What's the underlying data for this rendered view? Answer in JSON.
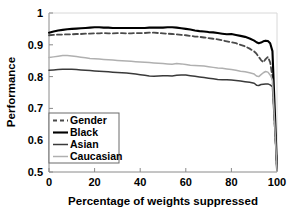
{
  "chart_data": {
    "type": "line",
    "title": "",
    "xlabel": "Percentage of weights suppressed",
    "ylabel": "Performance",
    "xlim": [
      0,
      100
    ],
    "ylim": [
      0.5,
      1.0
    ],
    "xticks": [
      "0",
      "20",
      "40",
      "60",
      "80",
      "100"
    ],
    "xtick_values": [
      0,
      20,
      40,
      60,
      80,
      100
    ],
    "yticks": [
      "0.5",
      "0.6",
      "0.7",
      "0.8",
      "0.9",
      "1"
    ],
    "ytick_values": [
      0.5,
      0.6,
      0.7,
      0.8,
      0.9,
      1.0
    ],
    "grid": false,
    "legend_position": "lower left",
    "x": [
      0,
      2,
      4,
      6,
      8,
      10,
      12,
      14,
      16,
      18,
      20,
      22,
      24,
      26,
      28,
      30,
      32,
      34,
      36,
      38,
      40,
      42,
      44,
      46,
      48,
      50,
      52,
      54,
      56,
      58,
      60,
      62,
      64,
      66,
      68,
      70,
      72,
      74,
      76,
      78,
      80,
      82,
      84,
      86,
      88,
      90,
      91,
      92,
      93,
      94,
      95,
      96,
      97,
      98,
      99,
      100
    ],
    "series": [
      {
        "name": "Gender",
        "style": "dashed",
        "color": "#4a4a4a",
        "width": 1.8,
        "values": [
          0.93,
          0.931,
          0.932,
          0.932,
          0.933,
          0.933,
          0.934,
          0.934,
          0.935,
          0.935,
          0.936,
          0.936,
          0.937,
          0.936,
          0.936,
          0.937,
          0.937,
          0.936,
          0.936,
          0.937,
          0.937,
          0.937,
          0.938,
          0.938,
          0.937,
          0.936,
          0.935,
          0.934,
          0.933,
          0.931,
          0.93,
          0.928,
          0.926,
          0.925,
          0.923,
          0.921,
          0.919,
          0.917,
          0.914,
          0.911,
          0.908,
          0.905,
          0.9,
          0.895,
          0.888,
          0.879,
          0.872,
          0.862,
          0.852,
          0.845,
          0.855,
          0.862,
          0.845,
          0.8,
          0.65,
          0.51
        ]
      },
      {
        "name": "Black",
        "style": "solid",
        "color": "#000000",
        "width": 2.1,
        "values": [
          0.938,
          0.942,
          0.945,
          0.947,
          0.949,
          0.95,
          0.951,
          0.952,
          0.953,
          0.954,
          0.955,
          0.955,
          0.954,
          0.954,
          0.953,
          0.953,
          0.953,
          0.953,
          0.953,
          0.953,
          0.953,
          0.953,
          0.954,
          0.954,
          0.954,
          0.954,
          0.955,
          0.955,
          0.954,
          0.952,
          0.95,
          0.948,
          0.945,
          0.943,
          0.942,
          0.94,
          0.939,
          0.937,
          0.935,
          0.933,
          0.934,
          0.931,
          0.928,
          0.925,
          0.92,
          0.913,
          0.908,
          0.905,
          0.907,
          0.911,
          0.913,
          0.912,
          0.905,
          0.88,
          0.7,
          0.51
        ]
      },
      {
        "name": "Asian",
        "style": "solid",
        "color": "#3a3a3a",
        "width": 1.5,
        "values": [
          0.82,
          0.821,
          0.822,
          0.823,
          0.823,
          0.823,
          0.822,
          0.821,
          0.82,
          0.819,
          0.818,
          0.817,
          0.816,
          0.815,
          0.814,
          0.813,
          0.812,
          0.811,
          0.81,
          0.808,
          0.806,
          0.804,
          0.802,
          0.801,
          0.802,
          0.803,
          0.803,
          0.802,
          0.804,
          0.805,
          0.805,
          0.803,
          0.801,
          0.799,
          0.797,
          0.795,
          0.793,
          0.791,
          0.79,
          0.79,
          0.789,
          0.788,
          0.786,
          0.784,
          0.782,
          0.779,
          0.773,
          0.772,
          0.775,
          0.776,
          0.777,
          0.777,
          0.774,
          0.768,
          0.64,
          0.505
        ]
      },
      {
        "name": "Caucasian",
        "style": "solid",
        "color": "#b0b0b0",
        "width": 1.5,
        "values": [
          0.86,
          0.862,
          0.864,
          0.866,
          0.866,
          0.865,
          0.863,
          0.861,
          0.859,
          0.857,
          0.856,
          0.855,
          0.854,
          0.853,
          0.852,
          0.851,
          0.85,
          0.849,
          0.848,
          0.847,
          0.846,
          0.845,
          0.844,
          0.843,
          0.842,
          0.841,
          0.84,
          0.839,
          0.841,
          0.84,
          0.838,
          0.836,
          0.835,
          0.834,
          0.833,
          0.831,
          0.829,
          0.827,
          0.826,
          0.824,
          0.822,
          0.82,
          0.817,
          0.815,
          0.812,
          0.808,
          0.802,
          0.8,
          0.806,
          0.812,
          0.816,
          0.814,
          0.805,
          0.79,
          0.65,
          0.505
        ]
      }
    ]
  },
  "legend": {
    "entries": [
      {
        "label": "Gender"
      },
      {
        "label": "Black"
      },
      {
        "label": "Asian"
      },
      {
        "label": "Caucasian"
      }
    ]
  }
}
